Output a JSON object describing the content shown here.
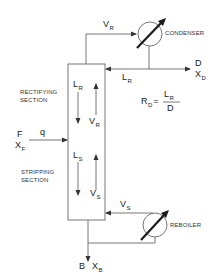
{
  "diagram": {
    "type": "distillation-column-schematic",
    "colors": {
      "line": "#555555",
      "text": "#222222",
      "background": "#ffffff"
    },
    "units": {
      "condenser": {
        "label": "CONDENSER"
      },
      "reboiler": {
        "label": "REBOILER"
      },
      "column": {
        "rectifying_section": {
          "line1": "RECTIFYING",
          "line2": "SECTION"
        },
        "stripping_section": {
          "line1": "STRIPPING",
          "line2": "SECTION"
        }
      }
    },
    "streams": {
      "vapor_top": {
        "main": "V",
        "sub": "R"
      },
      "reflux": {
        "main": "L",
        "sub": "R"
      },
      "distillate": {
        "name": "D",
        "comp_main": "X",
        "comp_sub": "D"
      },
      "feed": {
        "name": "F",
        "comp_main": "X",
        "comp_sub": "F",
        "quality": "q"
      },
      "liquid_rectifying": {
        "main": "L",
        "sub": "R"
      },
      "vapor_rectifying": {
        "main": "V",
        "sub": "R"
      },
      "liquid_stripping": {
        "main": "L",
        "sub": "S"
      },
      "vapor_stripping": {
        "main": "V",
        "sub": "S"
      },
      "vapor_reboiler": {
        "main": "V",
        "sub": "S"
      },
      "bottoms": {
        "name": "B",
        "comp_main": "X",
        "comp_sub": "B"
      }
    },
    "equation": {
      "lhs_main": "R",
      "lhs_sub": "D",
      "equals": "=",
      "num_main": "L",
      "num_sub": "R",
      "den": "D"
    }
  }
}
